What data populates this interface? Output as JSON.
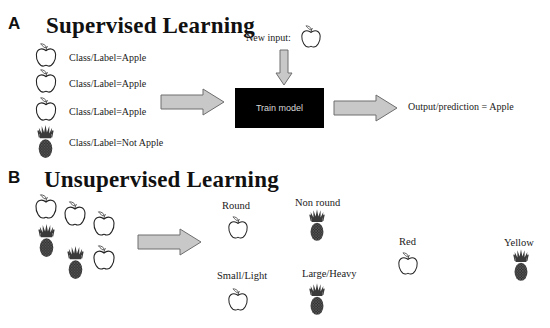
{
  "panel_a": {
    "letter": "A",
    "title": "Supervised Learning",
    "training_items": [
      {
        "icon": "apple",
        "label": "Class/Label=Apple"
      },
      {
        "icon": "apple",
        "label": "Class/Label=Apple"
      },
      {
        "icon": "apple",
        "label": "Class/Label=Apple"
      },
      {
        "icon": "pineapple",
        "label": "Class/Label=Not Apple"
      }
    ],
    "new_input_label": "New input:",
    "new_input_icon": "apple",
    "model_box_label": "Train model",
    "output_label": "Output/prediction = Apple"
  },
  "panel_b": {
    "letter": "B",
    "title": "Unsupervised Learning",
    "input_items": [
      "apple",
      "apple",
      "apple",
      "pineapple",
      "pineapple",
      "apple"
    ],
    "clusters": [
      {
        "label": "Round",
        "icon": "apple"
      },
      {
        "label": "Non round",
        "icon": "pineapple"
      },
      {
        "label": "Small/Light",
        "icon": "apple"
      },
      {
        "label": "Large/Heavy",
        "icon": "pineapple"
      },
      {
        "label": "Red",
        "icon": "apple"
      },
      {
        "label": "Yellow",
        "icon": "pineapple"
      }
    ]
  },
  "colors": {
    "arrow_fill": "#c8c8c8",
    "arrow_stroke": "#6e6e6e",
    "model_box": "#000000",
    "model_text": "#d8d8d8",
    "pineapple": "#3a3a3a"
  }
}
